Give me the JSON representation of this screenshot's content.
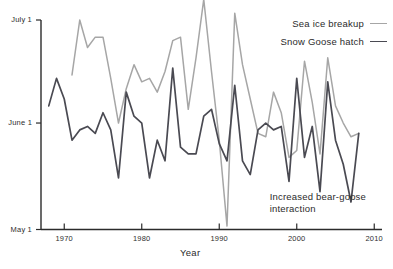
{
  "chart_data": {
    "type": "line",
    "title": "",
    "xlabel": "Year",
    "ylabel": "",
    "xlim": [
      1967,
      2011
    ],
    "ylim": [
      0,
      61
    ],
    "grid": false,
    "legend_position": "top-right",
    "y_tick_labels": [
      "July 1",
      "June 1",
      "May 1"
    ],
    "y_tick_values": [
      61,
      31,
      0
    ],
    "x_tick_labels": [
      "1970",
      "1980",
      "1990",
      "2000",
      "2010"
    ],
    "x_tick_values": [
      1970,
      1980,
      1990,
      2000,
      2010
    ],
    "y_axis_note": "Day of year expressed as calendar date; May 1 = 0, June 1 = 31, July 1 = 61",
    "annotations": [
      {
        "name": "bear-goose-note",
        "lines": [
          "Increased bear-goose",
          "interaction"
        ],
        "x": 1996.5,
        "y": 9
      }
    ],
    "series": [
      {
        "name": "Sea ice breakup",
        "color": "#a6a6a6",
        "x": [
          1971,
          1972,
          1973,
          1974,
          1975,
          1976,
          1977,
          1978,
          1979,
          1980,
          1981,
          1982,
          1983,
          1984,
          1985,
          1986,
          1987,
          1988,
          1989,
          1990,
          1991,
          1992,
          1993,
          1994,
          1995,
          1996,
          1997,
          1998,
          1999,
          2000,
          2001,
          2002,
          2003,
          2004,
          2005,
          2006,
          2007,
          2008
        ],
        "values": [
          45,
          61,
          53,
          56,
          56,
          44,
          31,
          41,
          48,
          43,
          44,
          40,
          46,
          55,
          56,
          35,
          50,
          67,
          46,
          26,
          1,
          63,
          48,
          38,
          28,
          27,
          40,
          34,
          21,
          23,
          49,
          37,
          22,
          50,
          36,
          31,
          27,
          28
        ]
      },
      {
        "name": "Snow Goose hatch",
        "color": "#4a4a52",
        "x": [
          1968,
          1969,
          1970,
          1971,
          1972,
          1973,
          1974,
          1975,
          1976,
          1977,
          1978,
          1979,
          1980,
          1981,
          1982,
          1983,
          1984,
          1985,
          1986,
          1987,
          1988,
          1989,
          1990,
          1991,
          1992,
          1993,
          1994,
          1995,
          1996,
          1997,
          1998,
          1999,
          2000,
          2001,
          2002,
          2003,
          2004,
          2005,
          2006,
          2007,
          2008
        ],
        "values": [
          36,
          44,
          38,
          26,
          29,
          30,
          28,
          34,
          29,
          15,
          40,
          33,
          31,
          15,
          26,
          20,
          47,
          24,
          22,
          22,
          33,
          35,
          25,
          20,
          42,
          20,
          16,
          29,
          31,
          29,
          30,
          14,
          44,
          21,
          30,
          11,
          43,
          26,
          19,
          8,
          28
        ]
      }
    ]
  },
  "legend": {
    "items": [
      {
        "label": "Sea ice breakup",
        "color": "#a6a6a6"
      },
      {
        "label": "Snow Goose hatch",
        "color": "#4a4a52"
      }
    ]
  },
  "axes": {
    "x_title": "Year",
    "axis_color": "#2b2b2b"
  }
}
